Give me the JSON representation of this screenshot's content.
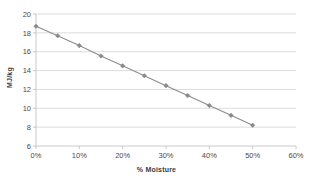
{
  "chart_data": {
    "type": "line",
    "title": "",
    "xlabel": "% Moisture",
    "ylabel": "MJ/kg",
    "xlim": [
      0,
      60
    ],
    "ylim": [
      6,
      20
    ],
    "grid": true,
    "legend": "none",
    "x": [
      0,
      5,
      10,
      15,
      20,
      25,
      30,
      35,
      40,
      45,
      50
    ],
    "values": [
      18.7,
      17.7,
      16.65,
      15.55,
      14.5,
      13.45,
      12.4,
      11.35,
      10.3,
      9.25,
      8.2
    ],
    "series": [
      {
        "name": "Energy content",
        "values": [
          18.7,
          17.7,
          16.65,
          15.55,
          14.5,
          13.45,
          12.4,
          11.35,
          10.3,
          9.25,
          8.2
        ],
        "color": "#8a8a8a",
        "marker": "diamond"
      }
    ],
    "x_tick_labels": [
      "0%",
      "10%",
      "20%",
      "30%",
      "40%",
      "50%",
      "60%"
    ],
    "x_tick_values": [
      0,
      10,
      20,
      30,
      40,
      50,
      60
    ],
    "y_tick_labels": [
      "6",
      "8",
      "10",
      "12",
      "14",
      "16",
      "18",
      "20"
    ],
    "y_tick_values": [
      6,
      8,
      10,
      12,
      14,
      16,
      18,
      20
    ],
    "colors": {
      "series": "#8a8a8a",
      "gridline": "#d4d4d4",
      "axis": "#c4c4c4",
      "text": "#4a4a4a",
      "background": "#ffffff"
    }
  }
}
